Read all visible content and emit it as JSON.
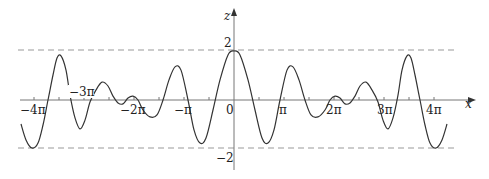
{
  "chart_data": {
    "type": "line",
    "title": "",
    "xlabel": "x",
    "ylabel": "z",
    "xlim_px": [
      20,
      470
    ],
    "x_ticks": [
      {
        "label": "−4π",
        "value": -12.566
      },
      {
        "label": "−3π",
        "value": -9.425
      },
      {
        "label": "−2π",
        "value": -6.283
      },
      {
        "label": "−π",
        "value": -3.142
      },
      {
        "label": "0",
        "value": 0
      },
      {
        "label": "π",
        "value": 3.142
      },
      {
        "label": "2π",
        "value": 6.283
      },
      {
        "label": "3π",
        "value": 9.425
      },
      {
        "label": "4π",
        "value": 12.566
      }
    ],
    "minor_tick_step": "π/2",
    "y_ticks": [
      {
        "label": "2",
        "value": 2
      },
      {
        "label": "−2",
        "value": -2
      }
    ],
    "reference_lines": [
      {
        "type": "dashed-horizontal",
        "value": 2
      },
      {
        "type": "dashed-horizontal",
        "value": -2
      }
    ],
    "xlim": [
      -4.3,
      4.3
    ],
    "xlim_units": "π",
    "ylim": [
      -2.6,
      2.8
    ],
    "grid": false,
    "legend": null,
    "symmetry": "even (symmetric about z-axis)",
    "series": [
      {
        "name": "z(x)",
        "x_pi": [
          0,
          0.12,
          0.28,
          0.42,
          0.56,
          0.68,
          0.8,
          0.92,
          1.06,
          1.18,
          1.3,
          1.42,
          1.54,
          1.68,
          1.82,
          1.92,
          2.02,
          2.12,
          2.22,
          2.32,
          2.42,
          2.52,
          2.64,
          2.76,
          2.88,
          2.98,
          3.08,
          3.18,
          3.28,
          3.36,
          3.46,
          3.54,
          3.62,
          3.72,
          3.82,
          3.92,
          4.04,
          4.16,
          4.26
        ],
        "z": [
          2.0,
          1.84,
          0.82,
          -0.41,
          -1.55,
          -1.76,
          -1.22,
          0.0,
          1.22,
          1.35,
          0.82,
          0.0,
          -0.61,
          -0.69,
          -0.41,
          0.0,
          0.16,
          0.08,
          -0.16,
          -0.12,
          0.16,
          0.57,
          0.73,
          0.41,
          -0.08,
          -0.82,
          -1.18,
          -0.73,
          0.2,
          1.22,
          1.8,
          1.71,
          1.02,
          0.0,
          -1.02,
          -1.76,
          -1.96,
          -1.63,
          -0.98
        ]
      }
    ]
  },
  "axis_labels": {
    "x": "x",
    "z": "z",
    "origin": "0",
    "z_max": "2",
    "z_min": "−2"
  }
}
